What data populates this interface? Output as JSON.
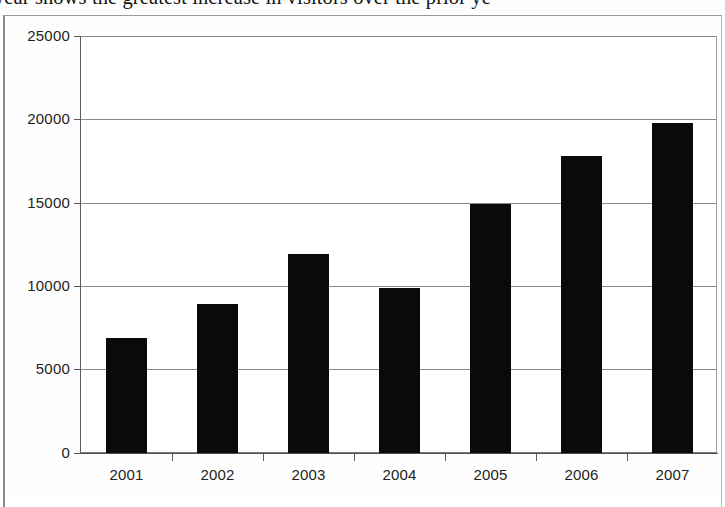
{
  "question": {
    "clipped_text": "year shows the greatest increase in visitors over the prior ye"
  },
  "chart_data": {
    "type": "bar",
    "title": "",
    "subtitle": "",
    "xlabel": "",
    "ylabel": "",
    "categories": [
      "2001",
      "2002",
      "2003",
      "2004",
      "2005",
      "2006",
      "2007"
    ],
    "values": [
      6900,
      8900,
      11900,
      9900,
      14900,
      17800,
      19800
    ],
    "series": [
      {
        "name": "Visitors",
        "values": [
          6900,
          8900,
          11900,
          9900,
          14900,
          17800,
          19800
        ]
      }
    ],
    "ylim": [
      0,
      25000
    ],
    "yticks": [
      0,
      5000,
      10000,
      15000,
      20000,
      25000
    ],
    "ytick_labels": [
      "0",
      "5000",
      "10000",
      "15000",
      "20000",
      "25000"
    ],
    "xtick_labels": [
      "2001",
      "2002",
      "2003",
      "2004",
      "2005",
      "2006",
      "2007"
    ],
    "grid": "horizontal",
    "legend": "none",
    "bar_color": "#0b0a0a",
    "plot_background": "#ffffff",
    "axis_color": "#5c5c5c",
    "gridline_color": "#8a8a8a",
    "text_color": "#231f1c"
  },
  "axis": {
    "y_labels": [
      "25000",
      "20000",
      "15000",
      "10000",
      "5000",
      "0"
    ],
    "x_labels": [
      "2001",
      "2002",
      "2003",
      "2004",
      "2005",
      "2006",
      "2007"
    ]
  }
}
